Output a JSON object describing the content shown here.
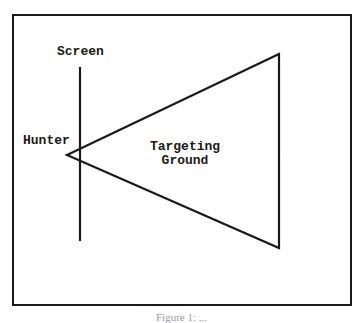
{
  "diagram": {
    "labels": {
      "screen": "Screen",
      "hunter": "Hunter",
      "targeting_ground_line1": "Targeting",
      "targeting_ground_line2": "Ground"
    },
    "caption": "Figure 1: ...",
    "colors": {
      "stroke": "#1a1a1a",
      "background": "#ffffff"
    },
    "shapes": {
      "screen_line": {
        "x": 80,
        "y1": 67,
        "y2": 241
      },
      "triangle": {
        "apex": [
          67,
          155
        ],
        "top": [
          279,
          54
        ],
        "bottom": [
          279,
          248
        ]
      }
    }
  }
}
